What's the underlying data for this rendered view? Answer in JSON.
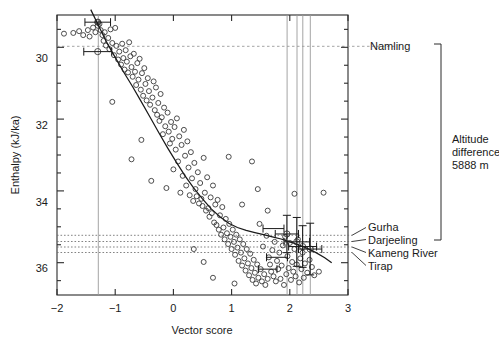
{
  "chart_data": {
    "type": "scatter",
    "title": "",
    "xlabel": "Vector score",
    "ylabel": "Enthalpy (kJ/ka)",
    "xlim": [
      -2,
      3
    ],
    "ylim": [
      36.9,
      29.1
    ],
    "y_inverted": true,
    "grid": false,
    "legend": null,
    "xticks": [
      -2,
      -1,
      0,
      1,
      2,
      3
    ],
    "xtick_labels": [
      "−2",
      "−1",
      "0",
      "1",
      "2",
      "3"
    ],
    "yticks": [
      30,
      32,
      34,
      36
    ],
    "ytick_labels": [
      "30",
      "32",
      "34",
      "36"
    ],
    "yticks_minor": [
      29.5,
      30.5,
      31,
      31.5,
      32.5,
      33,
      33.5,
      34.5,
      35,
      35.5,
      36.5
    ],
    "series": [
      {
        "name": "samples",
        "marker": "open-circle",
        "points": [
          [
            -1.88,
            29.62
          ],
          [
            -1.72,
            29.6
          ],
          [
            -1.62,
            29.55
          ],
          [
            -1.55,
            29.66
          ],
          [
            -1.47,
            29.52
          ],
          [
            -1.44,
            29.7
          ],
          [
            -1.38,
            29.45
          ],
          [
            -1.34,
            29.58
          ],
          [
            -1.3,
            29.4
          ],
          [
            -1.3,
            29.3
          ],
          [
            -1.27,
            29.35
          ],
          [
            -1.25,
            29.52
          ],
          [
            -1.22,
            29.66
          ],
          [
            -1.2,
            29.82
          ],
          [
            -1.18,
            29.58
          ],
          [
            -1.16,
            29.95
          ],
          [
            -1.12,
            29.74
          ],
          [
            -1.1,
            30.05
          ],
          [
            -1.08,
            29.5
          ],
          [
            -1.05,
            29.88
          ],
          [
            -1.02,
            30.22
          ],
          [
            -1.0,
            29.46
          ],
          [
            -0.98,
            29.96
          ],
          [
            -0.95,
            30.34
          ],
          [
            -0.93,
            30.12
          ],
          [
            -0.9,
            30.48
          ],
          [
            -0.88,
            29.9
          ],
          [
            -0.86,
            30.3
          ],
          [
            -0.84,
            30.62
          ],
          [
            -0.82,
            30.08
          ],
          [
            -0.8,
            30.4
          ],
          [
            -0.78,
            30.7
          ],
          [
            -0.76,
            29.86
          ],
          [
            -0.74,
            30.25
          ],
          [
            -0.72,
            30.55
          ],
          [
            -0.7,
            30.82
          ],
          [
            -0.68,
            30.18
          ],
          [
            -0.66,
            30.68
          ],
          [
            -0.64,
            31.05
          ],
          [
            -0.62,
            30.44
          ],
          [
            -0.6,
            30.9
          ],
          [
            -0.58,
            30.32
          ],
          [
            -0.56,
            31.18
          ],
          [
            -0.54,
            30.72
          ],
          [
            -0.52,
            31.35
          ],
          [
            -0.5,
            30.58
          ],
          [
            -0.48,
            31.02
          ],
          [
            -0.46,
            31.48
          ],
          [
            -0.44,
            30.86
          ],
          [
            -0.42,
            31.22
          ],
          [
            -0.4,
            31.6
          ],
          [
            -0.38,
            33.72
          ],
          [
            -0.36,
            31.4
          ],
          [
            -0.34,
            30.95
          ],
          [
            -0.32,
            31.75
          ],
          [
            -0.3,
            31.12
          ],
          [
            -0.28,
            31.88
          ],
          [
            -0.26,
            31.55
          ],
          [
            -0.24,
            32.05
          ],
          [
            -0.22,
            31.3
          ],
          [
            -0.2,
            31.95
          ],
          [
            -0.18,
            32.42
          ],
          [
            -0.16,
            31.68
          ],
          [
            -0.14,
            32.2
          ],
          [
            -0.12,
            33.92
          ],
          [
            -0.1,
            31.82
          ],
          [
            -0.08,
            32.35
          ],
          [
            -0.06,
            32.68
          ],
          [
            -0.04,
            32.08
          ],
          [
            -0.02,
            32.55
          ],
          [
            0.0,
            33.4
          ],
          [
            0.02,
            32.22
          ],
          [
            0.04,
            32.85
          ],
          [
            0.06,
            31.98
          ],
          [
            0.08,
            33.18
          ],
          [
            0.1,
            32.48
          ],
          [
            0.12,
            34.05
          ],
          [
            0.14,
            32.72
          ],
          [
            0.16,
            33.58
          ],
          [
            0.18,
            32.3
          ],
          [
            0.2,
            33.02
          ],
          [
            0.22,
            33.85
          ],
          [
            0.24,
            32.62
          ],
          [
            0.26,
            33.35
          ],
          [
            0.28,
            34.12
          ],
          [
            0.3,
            32.92
          ],
          [
            0.32,
            33.65
          ],
          [
            0.34,
            34.28
          ],
          [
            0.36,
            33.22
          ],
          [
            0.38,
            33.95
          ],
          [
            0.4,
            34.15
          ],
          [
            0.42,
            33.48
          ],
          [
            0.44,
            34.35
          ],
          [
            0.46,
            33.78
          ],
          [
            0.48,
            34.22
          ],
          [
            0.5,
            34.42
          ],
          [
            0.52,
            33.08
          ],
          [
            0.54,
            34.05
          ],
          [
            0.56,
            34.55
          ],
          [
            0.58,
            33.62
          ],
          [
            0.6,
            34.48
          ],
          [
            0.62,
            34.72
          ],
          [
            0.64,
            34.18
          ],
          [
            0.66,
            34.62
          ],
          [
            0.68,
            33.85
          ],
          [
            0.7,
            34.88
          ],
          [
            0.72,
            34.38
          ],
          [
            0.74,
            34.95
          ],
          [
            0.76,
            34.25
          ],
          [
            0.78,
            35.08
          ],
          [
            0.8,
            34.68
          ],
          [
            0.82,
            35.22
          ],
          [
            0.84,
            34.45
          ],
          [
            0.86,
            35.02
          ],
          [
            0.88,
            35.35
          ],
          [
            0.9,
            34.78
          ],
          [
            0.92,
            35.18
          ],
          [
            0.94,
            35.48
          ],
          [
            0.96,
            34.92
          ],
          [
            0.98,
            35.28
          ],
          [
            1.0,
            35.62
          ],
          [
            1.02,
            35.08
          ],
          [
            1.04,
            35.42
          ],
          [
            1.06,
            35.78
          ],
          [
            1.08,
            35.22
          ],
          [
            1.1,
            35.58
          ],
          [
            1.12,
            35.95
          ],
          [
            1.14,
            35.35
          ],
          [
            1.16,
            35.72
          ],
          [
            1.18,
            36.08
          ],
          [
            1.2,
            35.48
          ],
          [
            1.22,
            35.88
          ],
          [
            1.24,
            36.22
          ],
          [
            1.26,
            35.62
          ],
          [
            1.28,
            36.02
          ],
          [
            1.3,
            36.35
          ],
          [
            1.32,
            35.75
          ],
          [
            1.34,
            36.15
          ],
          [
            1.36,
            36.48
          ],
          [
            1.38,
            35.92
          ],
          [
            1.4,
            36.28
          ],
          [
            1.42,
            36.58
          ],
          [
            1.44,
            36.05
          ],
          [
            1.46,
            36.42
          ],
          [
            1.48,
            34.92
          ],
          [
            1.5,
            36.18
          ],
          [
            1.52,
            36.52
          ],
          [
            1.54,
            35.55
          ],
          [
            1.56,
            36.32
          ],
          [
            1.58,
            36.62
          ],
          [
            1.6,
            35.25
          ],
          [
            1.62,
            36.45
          ],
          [
            1.64,
            35.85
          ],
          [
            1.66,
            36.05
          ],
          [
            1.68,
            36.25
          ],
          [
            1.7,
            35.65
          ],
          [
            1.72,
            36.38
          ],
          [
            1.74,
            35.42
          ],
          [
            1.76,
            36.52
          ],
          [
            1.78,
            35.95
          ],
          [
            1.8,
            36.18
          ],
          [
            1.82,
            35.72
          ],
          [
            1.84,
            36.45
          ],
          [
            1.86,
            36.08
          ],
          [
            1.88,
            35.52
          ],
          [
            1.9,
            36.62
          ],
          [
            1.92,
            35.28
          ],
          [
            1.94,
            36.32
          ],
          [
            1.96,
            35.82
          ],
          [
            1.98,
            36.15
          ],
          [
            2.0,
            35.45
          ],
          [
            2.02,
            36.48
          ],
          [
            2.04,
            35.98
          ],
          [
            2.06,
            36.25
          ],
          [
            2.08,
            35.62
          ],
          [
            2.1,
            36.38
          ],
          [
            2.12,
            36.05
          ],
          [
            2.14,
            35.35
          ],
          [
            2.16,
            36.55
          ],
          [
            2.18,
            35.88
          ],
          [
            2.2,
            36.18
          ],
          [
            2.22,
            35.72
          ],
          [
            2.24,
            36.42
          ],
          [
            2.26,
            36.02
          ],
          [
            2.3,
            36.28
          ],
          [
            2.34,
            35.92
          ],
          [
            2.38,
            36.12
          ],
          [
            2.42,
            36.35
          ],
          [
            2.08,
            34.08
          ],
          [
            1.18,
            34.38
          ],
          [
            1.45,
            33.95
          ],
          [
            1.62,
            34.55
          ],
          [
            1.35,
            33.18
          ],
          [
            0.95,
            33.05
          ],
          [
            2.58,
            34.05
          ],
          [
            0.52,
            35.98
          ],
          [
            0.68,
            36.42
          ],
          [
            1.05,
            36.58
          ],
          [
            0.35,
            35.62
          ],
          [
            2.5,
            36.25
          ],
          [
            -0.55,
            32.58
          ],
          [
            -0.72,
            33.12
          ],
          [
            -1.05,
            31.52
          ]
        ]
      },
      {
        "name": "site-means",
        "marker": "open-circle-large",
        "points": [
          [
            -1.3,
            29.3
          ],
          [
            -1.3,
            30.12
          ],
          [
            1.95,
            35.2
          ],
          [
            2.12,
            35.42
          ],
          [
            2.22,
            35.55
          ],
          [
            2.35,
            35.62
          ]
        ]
      }
    ],
    "fit_curve": {
      "name": "fitted-trend",
      "points": [
        [
          -1.42,
          28.95
        ],
        [
          -1.3,
          29.35
        ],
        [
          -1.15,
          29.85
        ],
        [
          -1.0,
          30.28
        ],
        [
          -0.85,
          30.7
        ],
        [
          -0.7,
          31.1
        ],
        [
          -0.55,
          31.52
        ],
        [
          -0.4,
          31.95
        ],
        [
          -0.25,
          32.38
        ],
        [
          -0.1,
          32.8
        ],
        [
          0.05,
          33.2
        ],
        [
          0.2,
          33.58
        ],
        [
          0.35,
          33.92
        ],
        [
          0.5,
          34.22
        ],
        [
          0.65,
          34.5
        ],
        [
          0.8,
          34.72
        ],
        [
          0.95,
          34.9
        ],
        [
          1.1,
          35.02
        ],
        [
          1.25,
          35.1
        ],
        [
          1.4,
          35.16
        ],
        [
          1.55,
          35.22
        ],
        [
          1.7,
          35.28
        ],
        [
          1.85,
          35.34
        ],
        [
          2.0,
          35.42
        ],
        [
          2.15,
          35.5
        ],
        [
          2.3,
          35.6
        ],
        [
          2.45,
          35.72
        ],
        [
          2.6,
          35.86
        ],
        [
          2.72,
          36.0
        ]
      ]
    },
    "error_bars": [
      {
        "x": -1.3,
        "y": 29.3,
        "xerr": 0.22,
        "yerr": 0.0
      },
      {
        "x": -1.3,
        "y": 30.12,
        "xerr": 0.24,
        "yerr": 0.0
      },
      {
        "x": 1.95,
        "y": 35.2,
        "xerr": 0.2,
        "yerr": 0.52
      },
      {
        "x": 2.12,
        "y": 35.42,
        "xerr": 0.22,
        "yerr": 0.68
      },
      {
        "x": 2.22,
        "y": 35.55,
        "xerr": 0.24,
        "yerr": 0.58
      },
      {
        "x": 2.35,
        "y": 35.62,
        "xerr": 0.2,
        "yerr": 0.72
      },
      {
        "x": 1.72,
        "y": 35.05,
        "xerr": 0.18,
        "yerr": 0.0
      },
      {
        "x": 1.78,
        "y": 35.85,
        "xerr": 0.18,
        "yerr": 0.0
      },
      {
        "x": 1.62,
        "y": 36.18,
        "xerr": 0.16,
        "yerr": 0.0
      }
    ],
    "reference_lines": {
      "vertical": [
        {
          "name": "Namling",
          "x": -1.3
        },
        {
          "name": "Gurha",
          "x": 1.95
        },
        {
          "name": "Darjeeling",
          "x": 2.12
        },
        {
          "name": "Kameng River",
          "x": 2.22
        },
        {
          "name": "Tirap",
          "x": 2.35
        }
      ],
      "horizontal": [
        {
          "name": "Namling",
          "y": 29.62,
          "style": "dashed"
        },
        {
          "name": "Gurha",
          "y": 35.18,
          "style": "dotted"
        },
        {
          "name": "Darjeeling",
          "y": 35.36,
          "style": "dotted"
        },
        {
          "name": "Kameng River",
          "y": 35.52,
          "style": "dotted"
        },
        {
          "name": "Tirap",
          "y": 35.68,
          "style": "dotted"
        }
      ]
    },
    "annotations": [
      {
        "name": "namling-label",
        "text": "Namling",
        "y": 29.62
      },
      {
        "name": "gurha-label",
        "text": "Gurha",
        "y": 35.18
      },
      {
        "name": "darjeeling-label",
        "text": "Darjeeling",
        "y": 35.36
      },
      {
        "name": "kameng-river-label",
        "text": "Kameng River",
        "y": 35.52
      },
      {
        "name": "tirap-label",
        "text": "Tirap",
        "y": 35.68
      },
      {
        "name": "altitude-difference-label",
        "text": "Altitude\ndifference\n5888 m"
      }
    ]
  },
  "labels": {
    "xlabel": "Vector score",
    "ylabel": "Enthalpy (kJ/ka)",
    "namling": "Namling",
    "gurha": "Gurha",
    "darjeeling": "Darjeeling",
    "kameng_river": "Kameng River",
    "tirap": "Tirap",
    "altitude_line1": "Altitude",
    "altitude_line2": "difference",
    "altitude_line3": "5888 m",
    "xt0": "−2",
    "xt1": "−1",
    "xt2": "0",
    "xt3": "1",
    "xt4": "2",
    "xt5": "3",
    "yt0": "30",
    "yt1": "32",
    "yt2": "34",
    "yt3": "36"
  }
}
